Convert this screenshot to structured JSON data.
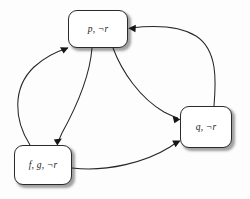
{
  "diagram": {
    "background_color": "#fdfdfd",
    "node_fill": "#ffffff",
    "node_stroke": "#2b2b2b",
    "edge_color": "#262626",
    "nodes": [
      {
        "id": "p",
        "label": "p, ¬r",
        "x": 68,
        "y": 10,
        "width": 60,
        "height": 38
      },
      {
        "id": "q",
        "label": "q, ¬r",
        "x": 180,
        "y": 106,
        "width": 52,
        "height": 42
      },
      {
        "id": "fg",
        "label": "f, g, ¬r",
        "x": 14,
        "y": 145,
        "width": 58,
        "height": 40
      }
    ],
    "edges": [
      {
        "from": "fg",
        "to": "p",
        "style": "curved",
        "direction": "up-left-bulge"
      },
      {
        "from": "p",
        "to": "fg",
        "style": "curved",
        "direction": "down-inner"
      },
      {
        "from": "p",
        "to": "q",
        "style": "curved",
        "direction": "down-right"
      },
      {
        "from": "q",
        "to": "p",
        "style": "curved",
        "direction": "up-right-loop"
      },
      {
        "from": "fg",
        "to": "q",
        "style": "curved",
        "direction": "right-sweep"
      }
    ]
  }
}
